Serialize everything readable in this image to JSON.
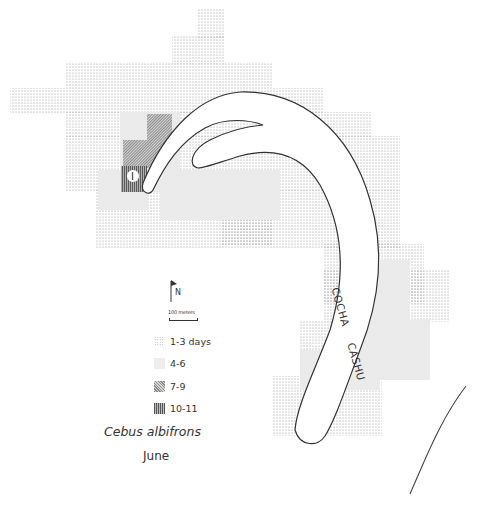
{
  "map": {
    "lake_label_1": "COCHA",
    "lake_label_2": "CASHU",
    "site_marker": "I"
  },
  "legend": {
    "north_label": "N",
    "scale_label": "100 meters",
    "items": [
      {
        "pattern": "sparse-dots",
        "label": "1-3 days"
      },
      {
        "pattern": "fine-dots",
        "label": "4-6"
      },
      {
        "pattern": "diagonal-hatch",
        "label": "7-9"
      },
      {
        "pattern": "vertical-hatch",
        "label": "10-11"
      }
    ],
    "species": "Cebus albifrons",
    "month": "June"
  }
}
